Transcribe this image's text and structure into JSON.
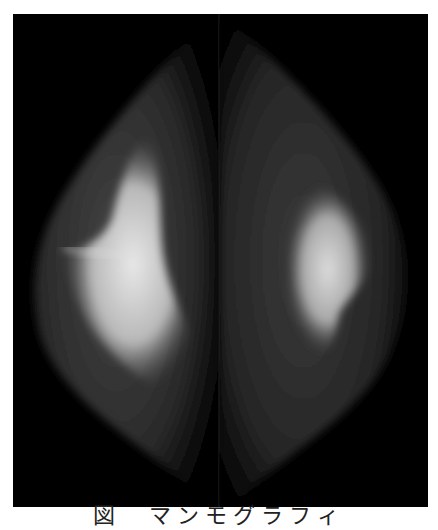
{
  "figure": {
    "caption": "図　マンモグラフィ",
    "panels": [
      {
        "id": "left",
        "description": "left breast view with dense bright glandular tissue"
      },
      {
        "id": "right",
        "description": "right breast view with dense bright glandular tissue"
      }
    ],
    "colors": {
      "background": "#000000",
      "tissue_dark": "#2a2a2a",
      "tissue_bright": "#e6e6e6",
      "page": "#ffffff"
    }
  }
}
